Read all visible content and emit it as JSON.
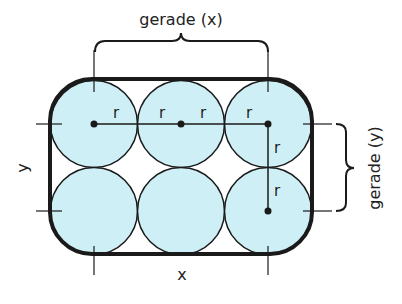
{
  "diagram": {
    "top_label": "gerade (x)",
    "right_label": "gerade (y)",
    "bottom_label": "x",
    "left_label": "y",
    "radius_label": "r",
    "colors": {
      "circle_fill": "#cdeff5",
      "stroke": "#1a1a1a",
      "background": "#ffffff"
    },
    "grid": {
      "rows": 2,
      "cols": 3
    }
  }
}
